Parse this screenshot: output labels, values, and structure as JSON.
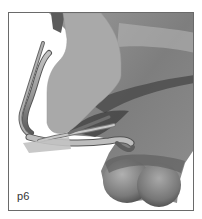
{
  "figure": {
    "panel_label": "p6",
    "colors": {
      "background": "#ffffff",
      "frame": "#6a6a6a",
      "cut_plane": "#a9a9a9",
      "surface_light": "#b8b8b8",
      "surface_mid": "#8c8c8c",
      "surface_dark": "#4a4a4a",
      "label_text": "#333333"
    }
  }
}
